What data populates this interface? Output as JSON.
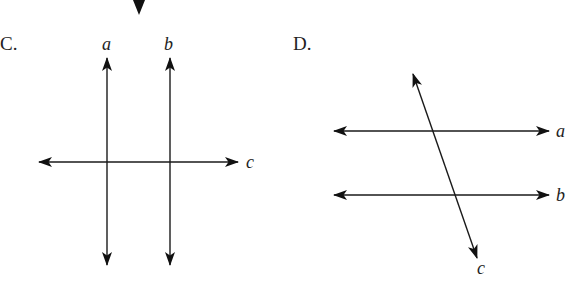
{
  "figures": [
    {
      "option_label": "C.",
      "lines": [
        {
          "name": "a",
          "label": "a",
          "orientation": "vertical"
        },
        {
          "name": "b",
          "label": "b",
          "orientation": "vertical"
        },
        {
          "name": "c",
          "label": "c",
          "orientation": "horizontal"
        }
      ],
      "relationship": "lines a and b parallel, both perpendicular to c"
    },
    {
      "option_label": "D.",
      "lines": [
        {
          "name": "a",
          "label": "a",
          "orientation": "horizontal"
        },
        {
          "name": "b",
          "label": "b",
          "orientation": "horizontal"
        },
        {
          "name": "c",
          "label": "c",
          "orientation": "oblique transversal"
        }
      ],
      "relationship": "lines a and b parallel, cut by transversal c"
    }
  ],
  "colors": {
    "line": "#1a1a1a",
    "background": "#ffffff"
  }
}
